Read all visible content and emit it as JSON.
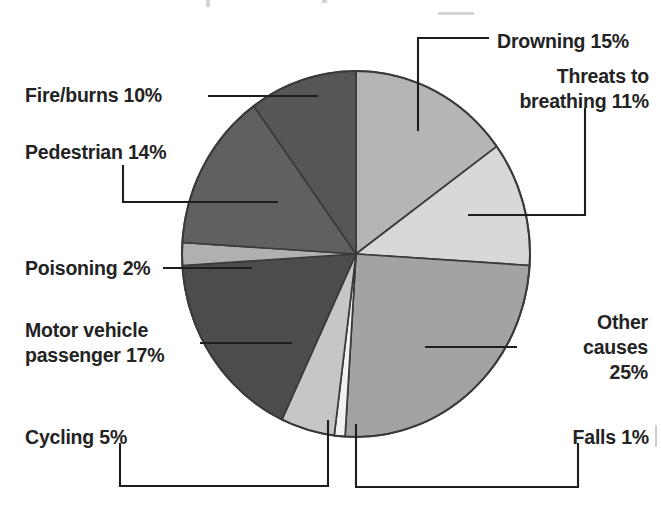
{
  "chart_data": {
    "type": "pie",
    "title": "",
    "xlabel": "",
    "ylabel": "",
    "legend_position": "callout-labels",
    "grid": false,
    "unit": "%",
    "start_angle_deg": 0,
    "direction": "clockwise",
    "categories": [
      "Drowning",
      "Threats to breathing",
      "Other causes",
      "Falls",
      "Cycling",
      "Motor vehicle passenger",
      "Poisoning",
      "Pedestrian",
      "Fire/burns"
    ],
    "values": [
      15,
      11,
      25,
      1,
      5,
      17,
      2,
      14,
      10
    ],
    "slices": [
      {
        "label": "Drowning",
        "value": 15,
        "value_text": "15%",
        "color": "#b5b5b5"
      },
      {
        "label": "Threats to breathing",
        "value": 11,
        "value_text": "11%",
        "color": "#d8d8d8"
      },
      {
        "label": "Other causes",
        "value": 25,
        "value_text": "25%",
        "color": "#a3a3a3"
      },
      {
        "label": "Falls",
        "value": 1,
        "value_text": "1%",
        "color": "#f2f2f2"
      },
      {
        "label": "Cycling",
        "value": 5,
        "value_text": "5%",
        "color": "#c6c6c6"
      },
      {
        "label": "Motor vehicle passenger",
        "value": 17,
        "value_text": "17%",
        "color": "#4c4c4c"
      },
      {
        "label": "Poisoning",
        "value": 2,
        "value_text": "2%",
        "color": "#b0b0b0"
      },
      {
        "label": "Pedestrian",
        "value": 14,
        "value_text": "14%",
        "color": "#606060"
      },
      {
        "label": "Fire/burns",
        "value": 10,
        "value_text": "10%",
        "color": "#565656"
      }
    ]
  },
  "labels": {
    "drowning": {
      "line1": "Drowning 15%"
    },
    "threats": {
      "line1": "Threats to",
      "line2": "breathing 11%"
    },
    "other": {
      "line1": "Other",
      "line2": "causes",
      "line3": "25%"
    },
    "falls": {
      "line1": "Falls 1%"
    },
    "cycling": {
      "line1": "Cycling 5%"
    },
    "motor": {
      "line1": "Motor vehicle",
      "line2": "passenger 17%"
    },
    "poisoning": {
      "line1": "Poisoning 2%"
    },
    "pedestrian": {
      "line1": "Pedestrian 14%"
    },
    "fire": {
      "line1": "Fire/burns 10%"
    }
  },
  "style": {
    "background": "#ffffff",
    "text_color": "#232323",
    "leader_color": "#1e1e1e",
    "outline_color": "#3a3a3a"
  }
}
